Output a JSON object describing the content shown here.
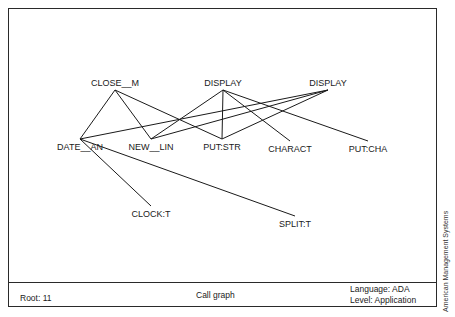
{
  "diagram": {
    "type": "call_graph",
    "nodes": [
      {
        "id": "close_m",
        "label": "CLOSE__M",
        "x": 115,
        "y": 82
      },
      {
        "id": "display1",
        "label": "DISPLAY",
        "x": 223,
        "y": 82
      },
      {
        "id": "display2",
        "label": "DISPLAY",
        "x": 328,
        "y": 82
      },
      {
        "id": "date_an",
        "label": "DATE__AN",
        "x": 80,
        "y": 141
      },
      {
        "id": "new_lin",
        "label": "NEW__LIN",
        "x": 151,
        "y": 141
      },
      {
        "id": "put_str",
        "label": "PUT:STR",
        "x": 222,
        "y": 141
      },
      {
        "id": "charact",
        "label": "CHARACT",
        "x": 290,
        "y": 143
      },
      {
        "id": "put_cha",
        "label": "PUT:CHA",
        "x": 368,
        "y": 143
      },
      {
        "id": "clock_t",
        "label": "CLOCK:T",
        "x": 151,
        "y": 208
      },
      {
        "id": "split_t",
        "label": "SPLIT:T",
        "x": 295,
        "y": 218
      }
    ],
    "edges": [
      [
        "close_m",
        "date_an"
      ],
      [
        "close_m",
        "new_lin"
      ],
      [
        "close_m",
        "put_str"
      ],
      [
        "display1",
        "new_lin"
      ],
      [
        "display1",
        "put_str"
      ],
      [
        "display1",
        "charact"
      ],
      [
        "display1",
        "put_cha"
      ],
      [
        "display2",
        "date_an"
      ],
      [
        "display2",
        "new_lin"
      ],
      [
        "display2",
        "put_str"
      ],
      [
        "date_an",
        "clock_t"
      ],
      [
        "date_an",
        "split_t"
      ]
    ]
  },
  "footer": {
    "root": "Root: 11",
    "title": "Call graph",
    "language": "Language: ADA",
    "level": "Level: Application"
  },
  "credit": "American Management Systems"
}
